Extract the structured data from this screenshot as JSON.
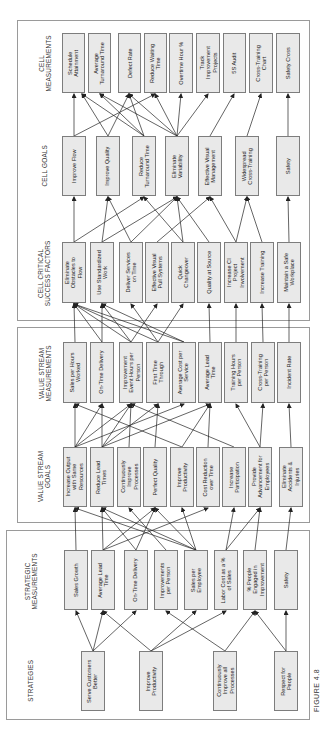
{
  "figure": {
    "caption": "FIGURE 4.8"
  },
  "panels": {
    "cell": {
      "headers": {
        "cell_measurements": "CELL\nMEASUREMENTS",
        "cell_goals": "CELL GOALS",
        "cell_csf": "CELL CRITICAL\nSUCCESS FACTORS"
      },
      "cell_measurements": [
        "Schedule\nAttainment",
        "Average\nTurnaround Time",
        "Defect Rate",
        "Reduce Waiting\nTime",
        "Overtime Hour %",
        "Track\nImprovement\nProjects",
        "5S Audit",
        "Cross-Training\nChart",
        "Safety Cross"
      ],
      "cell_goals": [
        "Improve Flow",
        "Improve Quality",
        "Reduce\nTurnaround Time",
        "Eliminate\nVariability",
        "Effective Visual\nManagement",
        "Widespread\nCross-Training",
        "Safety"
      ],
      "cell_csf": [
        "Eliminate\nObstacles to\nFlow",
        "Use Standardized\nWork",
        "Deliver Services\non Time",
        "Effective Visual\nPull Systems",
        "Quick\nChangeover",
        "Quality at Source",
        "Increase CI\nProject\nInvolvement",
        "Increase Training",
        "Maintain a Safe\nWorkplace"
      ]
    },
    "value_stream": {
      "headers": {
        "vs_measurements": "VALUE STREAM\nMEASUREMENTS",
        "vs_goals": "VALUE STREAM\nGOALS"
      },
      "vs_measurements": [
        "Sales per Hours\nWorked",
        "On-Time Delivery",
        "Improvement\nEvent Hours per\nPerson",
        "First Time\nThrough",
        "Average Cost per\nService",
        "Average Lead\nTime",
        "Training Hours\nper Person",
        "Cross-Training\nper Person",
        "Incident Rate"
      ],
      "vs_goals": [
        "Increase Output\nwith Same\nResources",
        "Reduce Lead\nTimes",
        "Continuously\nImprove\nProcesses",
        "Perfect Quality",
        "Improve\nProductivity",
        "Cost Reduction\nover Time",
        "Increase\nParticipation",
        "Provide\nAdvancement for\nEmployees",
        "Eliminate\nAccidents &\nInjuries"
      ]
    },
    "strategy": {
      "headers": {
        "strategic_measurements": "STRATEGIC\nMEASUREMENTS",
        "strategies": "STRATEGIES"
      },
      "strategic_measurements": [
        "Sales Growth",
        "Average Lead\nTime",
        "On-Time Delivery",
        "Improvements\nper Person",
        "Sales per\nEmployee",
        "Labor Cost as a %\nof Sales",
        "% People\nEngaged in\nImprovement",
        "Safety"
      ],
      "strategies": [
        "Serve Customers\nBetter",
        "Improve\nProductivity",
        "Continuously\nImprove all\nProcesses",
        "Respect for\nPeople"
      ]
    }
  },
  "colors": {
    "box_fill": "#e9e9e9",
    "box_border": "#7d7d7d",
    "line": "#222222",
    "panel_border": "#9a9a9a"
  }
}
